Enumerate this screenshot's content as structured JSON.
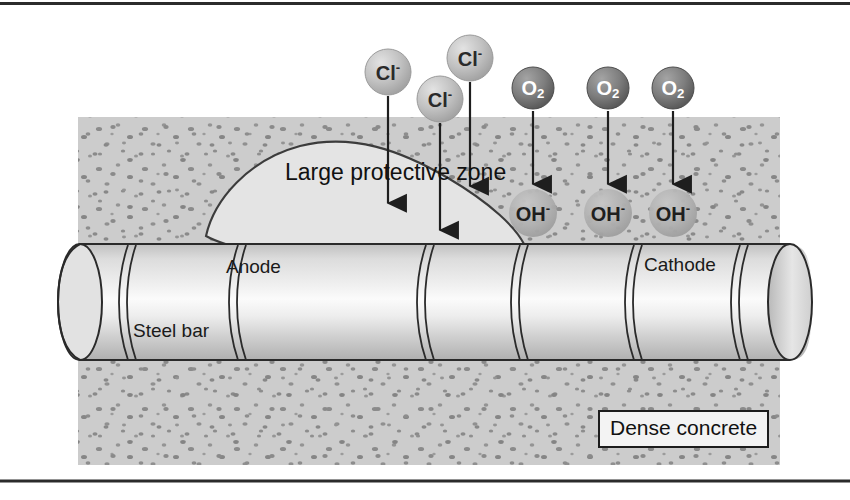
{
  "figure": {
    "background_color": "#ffffff",
    "frame_line_color": "#2b2b2b"
  },
  "concrete": {
    "label": "Dense concrete",
    "fill_color": "#cccccc",
    "speckle_color": "#8a8a8a",
    "x": 78,
    "y": 117,
    "width": 702,
    "height": 348
  },
  "steel_bar": {
    "label": "Steel bar",
    "fill_light": "#f2f2f2",
    "fill_shadow": "#b8b8b8",
    "outline_color": "#2a2a2a",
    "x": 52,
    "y": 245,
    "width": 760,
    "height": 115,
    "rib_count": 6
  },
  "zones": {
    "protective": {
      "label": "Large protective zone",
      "fill_color": "#e2e2e2",
      "outline_color": "#3a3a3a"
    },
    "anode": {
      "label": "Anode"
    },
    "cathode": {
      "label": "Cathode"
    }
  },
  "ions": {
    "chloride": {
      "symbol": "Cl",
      "charge": "-",
      "sphere_fill": "#bfbfbf",
      "sphere_edge": "#8f8f8f",
      "text_color": "#2a2a2a",
      "items": [
        {
          "cx": 388,
          "cy": 72,
          "r": 23,
          "arrow_to_y": 213
        },
        {
          "cx": 440,
          "cy": 99,
          "r": 23,
          "arrow_to_y": 240
        },
        {
          "cx": 470,
          "cy": 58,
          "r": 23,
          "arrow_to_y": 196
        }
      ]
    },
    "oxygen": {
      "symbol": "O",
      "subscript": "2",
      "sphere_fill": "#7c7c7c",
      "sphere_edge": "#4c4c4c",
      "text_color": "#ffffff",
      "items": [
        {
          "cx": 533,
          "cy": 88,
          "r": 21,
          "arrow_to_y": 193
        },
        {
          "cx": 608,
          "cy": 88,
          "r": 21,
          "arrow_to_y": 193
        },
        {
          "cx": 673,
          "cy": 88,
          "r": 21,
          "arrow_to_y": 193
        }
      ]
    },
    "hydroxide": {
      "symbol": "OH",
      "charge": "-",
      "sphere_fill": "#b4b4b4",
      "sphere_edge": "#9a9a9a",
      "text_color": "#1f1f1f",
      "items": [
        {
          "cx": 533,
          "cy": 213,
          "r": 24
        },
        {
          "cx": 608,
          "cy": 213,
          "r": 24
        },
        {
          "cx": 673,
          "cy": 213,
          "r": 24
        }
      ]
    }
  },
  "arrows": {
    "color": "#1e1e1e",
    "head_width": 9,
    "head_length": 13,
    "shaft_width": 2
  }
}
